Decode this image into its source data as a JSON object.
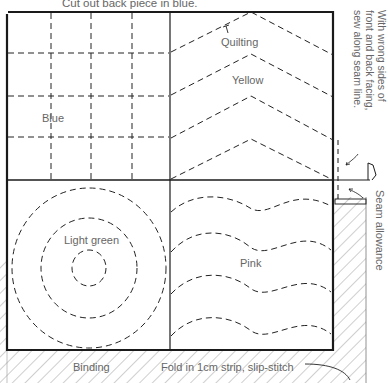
{
  "diagram": {
    "caption_top": "Cut out back piece in blue.",
    "patches": {
      "top_left": "Blue",
      "top_right_quilting": "Quilting",
      "top_right": "Yellow",
      "bottom_left": "Light green",
      "bottom_right": "Pink"
    },
    "side_note_lines": [
      "With wrong sides of",
      "front and back facing,",
      "sew along seam line."
    ],
    "seam_label": "Seam allowance",
    "binding_label": "Binding",
    "fold_label": "Fold in 1cm strip, slip-stitch",
    "colors": {
      "line": "#1a1a1a",
      "text": "#666666",
      "hatch": "#888888"
    }
  }
}
